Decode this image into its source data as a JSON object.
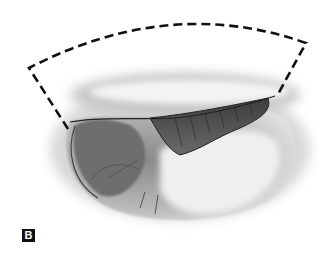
{
  "figure": {
    "panel_label": "B",
    "colors": {
      "background": "#ffffff",
      "outline": "#111111",
      "shading_dark": "#555555",
      "shading_light": "#e6e6e6"
    }
  }
}
